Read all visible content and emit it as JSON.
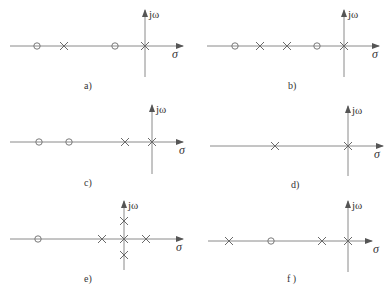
{
  "figure": {
    "axis_labels": {
      "imag": "jω",
      "real": "σ"
    },
    "panels": [
      {
        "id": "a",
        "caption": "a)",
        "zeros": [
          -4,
          -1
        ],
        "poles": [
          -3,
          0
        ]
      },
      {
        "id": "b",
        "caption": "b)",
        "zeros": [
          -4,
          -1
        ],
        "poles": [
          -3,
          -2,
          0
        ]
      },
      {
        "id": "c",
        "caption": "c)",
        "zeros": [
          -4,
          -3
        ],
        "poles": [
          -1,
          0
        ]
      },
      {
        "id": "d",
        "caption": "d)",
        "zeros": [],
        "poles": [
          -3,
          0
        ]
      },
      {
        "id": "e",
        "caption": "e)",
        "zeros": [
          -3
        ],
        "poles": [
          -1,
          0,
          1,
          "+j",
          "-j"
        ]
      },
      {
        "id": "f",
        "caption": "f )",
        "zeros": [
          -3
        ],
        "poles": [
          -4,
          -1,
          0
        ]
      }
    ]
  }
}
